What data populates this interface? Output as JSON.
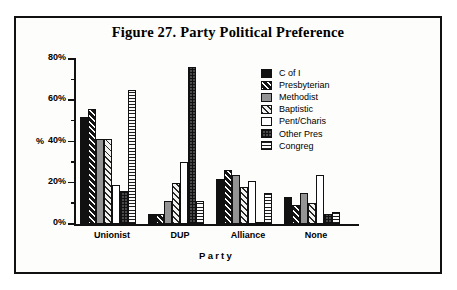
{
  "figure": {
    "title": "Figure 27. Party Political Preference"
  },
  "axes": {
    "y_title": "%",
    "x_title": "Party",
    "y_ticks": [
      "0%",
      "20%",
      "40%",
      "60%",
      "80%"
    ]
  },
  "legend": {
    "items": [
      {
        "label": "C of I",
        "pattern": "solid-black",
        "swatch_class": "p-solid-black"
      },
      {
        "label": "Presbyterian",
        "pattern": "diagonal-black",
        "swatch_class": "p-diag-black"
      },
      {
        "label": "Methodist",
        "pattern": "gray",
        "swatch_class": "p-gray"
      },
      {
        "label": "Baptistic",
        "pattern": "diagonal-light",
        "swatch_class": "p-diag-light"
      },
      {
        "label": "Pent/Charis",
        "pattern": "white",
        "swatch_class": "p-white"
      },
      {
        "label": "Other Pres",
        "pattern": "cross-dark",
        "swatch_class": "p-cross-dark"
      },
      {
        "label": "Congreg",
        "pattern": "horizontal",
        "swatch_class": "p-horiz"
      }
    ]
  },
  "chart_data": {
    "type": "bar",
    "title": "Figure 27. Party Political Preference",
    "xlabel": "Party",
    "ylabel": "%",
    "ylim": [
      0,
      80
    ],
    "ytick_step": 20,
    "yminor_step": 10,
    "grid": false,
    "legend_position": "right-inside",
    "categories": [
      "Unionist",
      "DUP",
      "Alliance",
      "None"
    ],
    "series": [
      {
        "name": "C of I",
        "values": [
          52,
          5,
          22,
          13
        ]
      },
      {
        "name": "Presbyterian",
        "values": [
          56,
          5,
          26,
          9
        ]
      },
      {
        "name": "Methodist",
        "values": [
          41,
          11,
          24,
          15
        ]
      },
      {
        "name": "Baptistic",
        "values": [
          41,
          20,
          18,
          10
        ]
      },
      {
        "name": "Pent/Charis",
        "values": [
          19,
          30,
          21,
          24
        ]
      },
      {
        "name": "Other Pres",
        "values": [
          16,
          76,
          1,
          5
        ]
      },
      {
        "name": "Congreg",
        "values": [
          65,
          11,
          15,
          6
        ]
      }
    ],
    "units": "percent"
  }
}
